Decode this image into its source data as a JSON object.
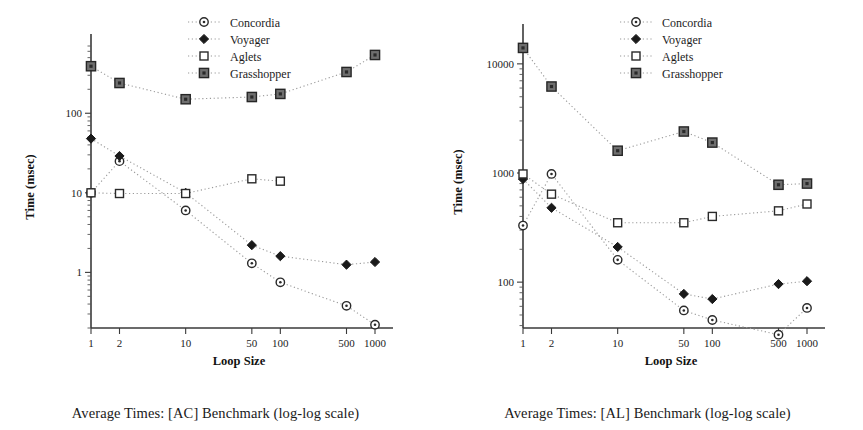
{
  "figure": {
    "panels": [
      "left",
      "right"
    ]
  },
  "chart_data": [
    {
      "type": "line",
      "panel": "left",
      "title": "Average Times: [AC] Benchmark (log-log scale)",
      "xlabel": "Loop Size",
      "ylabel": "Time (msec)",
      "xscale": "log",
      "yscale": "log",
      "grid": false,
      "legend_position": "top-center",
      "x": [
        1,
        2,
        10,
        50,
        100,
        500,
        1000
      ],
      "xtick_labels": [
        "1",
        "2",
        "10",
        "50",
        "100",
        "500",
        "1000"
      ],
      "ytick_labels": [
        "1",
        "10",
        "100"
      ],
      "ytick_values": [
        1,
        10,
        100
      ],
      "xlim": [
        1,
        1000
      ],
      "ylim": [
        0.2,
        700
      ],
      "series": [
        {
          "name": "Concordia",
          "marker": "open-circle",
          "values": [
            10,
            25,
            6,
            1.3,
            0.75,
            0.38,
            0.22
          ]
        },
        {
          "name": "Voyager",
          "marker": "filled-diamond",
          "values": [
            48,
            29,
            10,
            2.2,
            1.6,
            1.25,
            1.35
          ]
        },
        {
          "name": "Aglets",
          "marker": "open-square",
          "values": [
            10,
            9.8,
            9.8,
            15,
            14,
            null,
            null
          ]
        },
        {
          "name": "Grasshopper",
          "marker": "filled-square",
          "values": [
            390,
            240,
            150,
            160,
            175,
            330,
            540
          ]
        }
      ]
    },
    {
      "type": "line",
      "panel": "right",
      "title": "Average Times: [AL] Benchmark (log-log scale)",
      "xlabel": "Loop Size",
      "ylabel": "Time (msec)",
      "xscale": "log",
      "yscale": "log",
      "grid": false,
      "legend_position": "top-center",
      "x": [
        1,
        2,
        10,
        50,
        100,
        500,
        1000
      ],
      "xtick_labels": [
        "1",
        "2",
        "10",
        "50",
        "100",
        "500",
        "1000"
      ],
      "ytick_labels": [
        "100",
        "1000",
        "10000"
      ],
      "ytick_values": [
        100,
        1000,
        10000
      ],
      "xlim": [
        1,
        1000
      ],
      "ylim": [
        38,
        18000
      ],
      "series": [
        {
          "name": "Concordia",
          "marker": "open-circle",
          "values": [
            330,
            980,
            160,
            55,
            45,
            33,
            58
          ]
        },
        {
          "name": "Voyager",
          "marker": "filled-diamond",
          "values": [
            880,
            480,
            210,
            78,
            70,
            96,
            102
          ]
        },
        {
          "name": "Aglets",
          "marker": "open-square",
          "values": [
            980,
            640,
            350,
            350,
            400,
            450,
            520
          ]
        },
        {
          "name": "Grasshopper",
          "marker": "filled-square",
          "values": [
            14000,
            6200,
            1600,
            2400,
            1900,
            780,
            800
          ]
        }
      ]
    }
  ]
}
